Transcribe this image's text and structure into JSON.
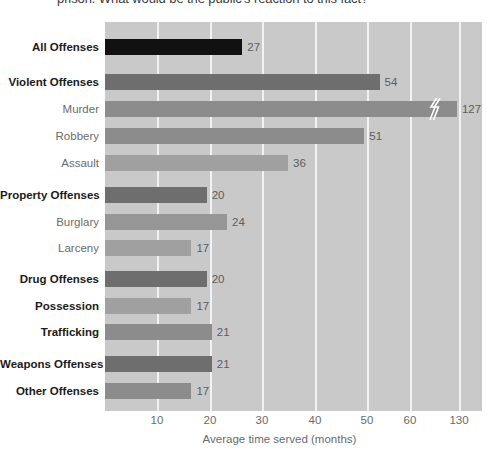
{
  "title": {
    "clipped_text": "prison. What would be the public's reaction to this fact?"
  },
  "axis": {
    "xlabel": "Average time served (months)",
    "ticks": [
      "10",
      "20",
      "30",
      "40",
      "50",
      "60",
      "130"
    ]
  },
  "chart_data": {
    "type": "bar",
    "orientation": "horizontal",
    "title": "prison. What would be the public's reaction to this fact?",
    "xlabel": "Average time served (months)",
    "ylabel": "",
    "xlim": [
      0,
      130
    ],
    "axis_break": {
      "present": true,
      "after_tick": 60,
      "next_tick": 130,
      "applies_to_category": "Murder"
    },
    "grid": "vertical",
    "legend": "none",
    "tick_labels": [
      "10",
      "20",
      "30",
      "40",
      "50",
      "60",
      "130"
    ],
    "categories": [
      "All Offenses",
      "Violent Offenses",
      "Murder",
      "Robbery",
      "Assault",
      "Property Offenses",
      "Burglary",
      "Larceny",
      "Drug Offenses",
      "Possession",
      "Trafficking",
      "Weapons Offenses",
      "Other Offenses"
    ],
    "values": [
      27,
      54,
      127,
      51,
      36,
      20,
      24,
      17,
      20,
      17,
      21,
      21,
      17
    ],
    "bars": [
      {
        "label": "All Offenses",
        "value": 27,
        "value_text": "27",
        "color": "#111111",
        "emphasis": "bold",
        "group": "total",
        "broken": false
      },
      {
        "label": "Violent Offenses",
        "value": 54,
        "value_text": "54",
        "color": "#6e6e6e",
        "emphasis": "bold",
        "group": "violent",
        "broken": false
      },
      {
        "label": "Murder",
        "value": 127,
        "value_text": "127",
        "color": "#8c8c8c",
        "emphasis": "plain",
        "group": "violent",
        "broken": true
      },
      {
        "label": "Robbery",
        "value": 51,
        "value_text": "51",
        "color": "#8c8c8c",
        "emphasis": "plain",
        "group": "violent",
        "broken": false
      },
      {
        "label": "Assault",
        "value": 36,
        "value_text": "36",
        "color": "#a0a0a0",
        "emphasis": "plain",
        "group": "violent",
        "broken": false
      },
      {
        "label": "Property Offenses",
        "value": 20,
        "value_text": "20",
        "color": "#6e6e6e",
        "emphasis": "bold",
        "group": "property",
        "broken": false
      },
      {
        "label": "Burglary",
        "value": 24,
        "value_text": "24",
        "color": "#969696",
        "emphasis": "plain",
        "group": "property",
        "broken": false
      },
      {
        "label": "Larceny",
        "value": 17,
        "value_text": "17",
        "color": "#a0a0a0",
        "emphasis": "plain",
        "group": "property",
        "broken": false
      },
      {
        "label": "Drug Offenses",
        "value": 20,
        "value_text": "20",
        "color": "#6e6e6e",
        "emphasis": "bold",
        "group": "drug",
        "broken": false
      },
      {
        "label": "Possession",
        "value": 17,
        "value_text": "17",
        "color": "#a0a0a0",
        "emphasis": "bold",
        "group": "drug",
        "broken": false
      },
      {
        "label": "Trafficking",
        "value": 21,
        "value_text": "21",
        "color": "#8c8c8c",
        "emphasis": "bold",
        "group": "drug",
        "broken": false
      },
      {
        "label": "Weapons Offenses",
        "value": 21,
        "value_text": "21",
        "color": "#6e6e6e",
        "emphasis": "bold",
        "group": "weapons",
        "broken": false
      },
      {
        "label": "Other Offenses",
        "value": 17,
        "value_text": "17",
        "color": "#8c8c8c",
        "emphasis": "bold",
        "group": "other",
        "broken": false
      }
    ]
  },
  "colors": {
    "plot_background": "#c9c9c9",
    "gridline": "#f2f2f2",
    "page_background": "#ffffff",
    "label_bold": "#1b1b1b",
    "label_plain": "#6b6b6b",
    "value_label": "#5d5d5d"
  }
}
